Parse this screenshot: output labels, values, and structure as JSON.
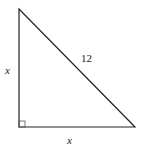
{
  "diagram": {
    "type": "right-triangle",
    "vertices": {
      "top": [
        19,
        9
      ],
      "right_angle": [
        19,
        127
      ],
      "bottom_right": [
        135,
        127
      ]
    },
    "labels": {
      "left_leg": "x",
      "hypotenuse": "12",
      "bottom_leg": "x"
    },
    "right_angle_marker": true,
    "stroke_color": "#222222"
  }
}
